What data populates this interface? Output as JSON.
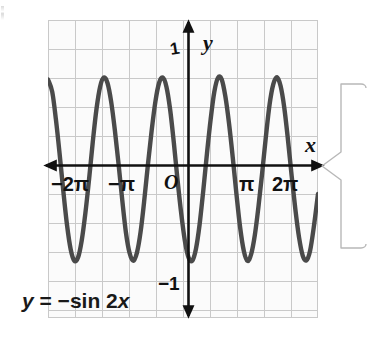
{
  "figure": {
    "equation_label": "y = −sin 2x",
    "axis_labels": {
      "x": "x",
      "y": "y"
    },
    "origin_label": "O",
    "y_tick_labels": {
      "top": "1",
      "bottom": "−1"
    },
    "x_tick_labels": [
      "−2π",
      "−π",
      "π",
      "2π"
    ],
    "colors": {
      "curve": "#4a4a4a",
      "axis": "#111111",
      "grid": "#c9c9c9",
      "grid_minor": "#e2e2e2",
      "plot_background": "#fbfbfb",
      "text": "#1a1a1a",
      "callout_outline": "#b8b8b8"
    }
  },
  "chart_data": {
    "type": "line",
    "title": "y = −sin 2x",
    "xlabel": "x",
    "ylabel": "y",
    "xlim": [
      -7.33,
      7.33
    ],
    "ylim": [
      -1.62,
      1.62
    ],
    "grid": true,
    "legend": "none",
    "function": "y = -sin(2x)",
    "amplitude": 1,
    "period": "π",
    "x_tick_values": [
      -6.283185,
      -3.141593,
      0,
      3.141593,
      6.283185
    ],
    "x_tick_labels": [
      "−2π",
      "−π",
      "O",
      "π",
      "2π"
    ],
    "y_tick_values": [
      1,
      -1
    ],
    "y_tick_labels": [
      "1",
      "−1"
    ],
    "maxima_x": [
      -5.497787,
      -3.926991,
      -2.356194,
      -0.785398,
      0.785398,
      2.356194,
      3.926991,
      5.497787
    ],
    "minima_x": [
      -4.712389,
      -3.141593,
      -1.570796,
      0,
      1.570796,
      3.141593,
      4.712389,
      6.283185
    ],
    "visible_peaks_x": [
      -5.497787,
      -2.356194,
      0.785398,
      3.926991,
      5.497787
    ],
    "series": [
      {
        "name": "y = -sin 2x",
        "x": [
          -7.33,
          -7.1,
          -6.9,
          -6.7,
          -6.5,
          -6.3,
          -6.1,
          -5.9,
          -5.7,
          -5.5,
          -5.3,
          -5.1,
          -4.9,
          -4.7,
          -4.5,
          -4.3,
          -4.1,
          -3.9,
          -3.7,
          -3.5,
          -3.3,
          -3.1,
          -2.9,
          -2.7,
          -2.5,
          -2.3,
          -2.1,
          -1.9,
          -1.7,
          -1.5,
          -1.3,
          -1.1,
          -0.9,
          -0.7,
          -0.5,
          -0.3,
          -0.1,
          0.1,
          0.3,
          0.5,
          0.7,
          0.9,
          1.1,
          1.3,
          1.5,
          1.7,
          1.9,
          2.1,
          2.3,
          2.5,
          2.7,
          2.9,
          3.1,
          3.3,
          3.5,
          3.7,
          3.9,
          4.1,
          4.3,
          4.5,
          4.7,
          4.9,
          5.1,
          5.3,
          5.5,
          5.7,
          5.9,
          6.1,
          6.3,
          6.5,
          6.7,
          6.9,
          7.1,
          7.33
        ],
        "y": [
          0.974,
          0.838,
          0.537,
          0.166,
          -0.236,
          -0.605,
          -0.872,
          -0.997,
          -0.963,
          -0.779,
          -0.479,
          -0.112,
          0.291,
          0.648,
          0.895,
          0.994,
          0.935,
          0.731,
          0.421,
          0.057,
          -0.335,
          -0.689,
          -0.914,
          -0.998,
          -0.909,
          -0.68,
          -0.335,
          0.057,
          0.421,
          0.731,
          0.935,
          0.994,
          0.895,
          0.648,
          0.291,
          -0.112,
          -0.479,
          -0.779,
          -0.963,
          -0.997,
          -0.872,
          -0.605,
          -0.236,
          0.166,
          0.537,
          0.838,
          0.992,
          0.975,
          0.789,
          0.494,
          0.128,
          -0.269,
          -0.632,
          -0.888,
          -0.998,
          -0.927,
          -0.719,
          -0.405,
          -0.039,
          0.351,
          0.7,
          0.92,
          0.998,
          0.902,
          0.665,
          0.316,
          -0.075,
          -0.437,
          -0.742,
          -0.941,
          -0.993,
          -0.888,
          -0.634,
          -0.271
        ]
      }
    ]
  }
}
